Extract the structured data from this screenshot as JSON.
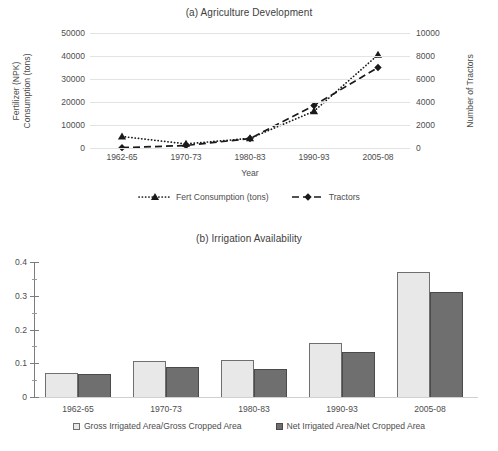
{
  "figure": {
    "background": "#ffffff",
    "panels": [
      "a",
      "b"
    ]
  },
  "panel_a": {
    "title": "(a) Agriculture Development",
    "xlabel": "Year",
    "ylabel_left_line1": "Fertilizer (NPK)",
    "ylabel_left_line2": "Consumption (tons)",
    "ylabel_right": "Number of Tractors",
    "yticks_left": [
      "0",
      "10000",
      "20000",
      "30000",
      "40000",
      "50000"
    ],
    "yticks_right": [
      "0",
      "2000",
      "4000",
      "6000",
      "8000",
      "10000"
    ],
    "xticks": [
      "1962-65",
      "1970-73",
      "1980-83",
      "1990-93",
      "2005-08"
    ],
    "legend": [
      {
        "label": "Fert Consumption (tons)",
        "style": "dotted",
        "marker": "triangle",
        "color": "#1a1a1a"
      },
      {
        "label": "Tractors",
        "style": "dashed",
        "marker": "diamond",
        "color": "#1a1a1a"
      }
    ]
  },
  "panel_b": {
    "title": "(b) Irrigation Availability",
    "yticks": [
      "0",
      "0.1",
      "0.2",
      "0.3",
      "0.4"
    ],
    "xticks": [
      "1962-65",
      "1970-73",
      "1980-83",
      "1990-93",
      "2005-08"
    ],
    "legend": [
      {
        "label": "Gross Irrigated Area/Gross Cropped Area",
        "color": "#e8e8e8"
      },
      {
        "label": "Net Irrigated Area/Net Cropped Area",
        "color": "#6f6f6f"
      }
    ]
  },
  "chart_data": [
    {
      "type": "line",
      "title": "(a) Agriculture Development",
      "xlabel": "Year",
      "ylabel": "Fertilizer (NPK) Consumption (tons)",
      "ylabel_secondary": "Number of Tractors",
      "categories": [
        "1962-65",
        "1970-73",
        "1980-83",
        "1990-93",
        "2005-08"
      ],
      "ylim": [
        0,
        50000
      ],
      "yticks": [
        0,
        10000,
        20000,
        30000,
        40000,
        50000
      ],
      "ylim_secondary": [
        0,
        10000
      ],
      "yticks_secondary": [
        0,
        2000,
        4000,
        6000,
        8000,
        10000
      ],
      "grid": true,
      "legend_position": "bottom",
      "series": [
        {
          "name": "Fert Consumption (tons)",
          "axis": "left",
          "linestyle": "dotted",
          "marker": "triangle",
          "color": "#1a1a1a",
          "values": [
            5000,
            1800,
            4200,
            16000,
            40500
          ]
        },
        {
          "name": "Tractors",
          "axis": "right",
          "linestyle": "dashed",
          "marker": "diamond",
          "color": "#1a1a1a",
          "values": [
            30,
            220,
            820,
            3700,
            7000
          ]
        }
      ]
    },
    {
      "type": "bar",
      "title": "(b) Irrigation Availability",
      "xlabel": "",
      "ylabel": "",
      "categories": [
        "1962-65",
        "1970-73",
        "1980-83",
        "1990-93",
        "2005-08"
      ],
      "ylim": [
        0,
        0.4
      ],
      "yticks": [
        0,
        0.1,
        0.2,
        0.3,
        0.4
      ],
      "grid": false,
      "legend_position": "bottom",
      "series": [
        {
          "name": "Gross Irrigated Area/Gross Cropped Area",
          "color": "#e8e8e8",
          "values": [
            0.07,
            0.107,
            0.109,
            0.16,
            0.37
          ]
        },
        {
          "name": "Net Irrigated Area/Net Cropped Area",
          "color": "#6f6f6f",
          "values": [
            0.068,
            0.088,
            0.083,
            0.132,
            0.31
          ]
        }
      ]
    }
  ]
}
